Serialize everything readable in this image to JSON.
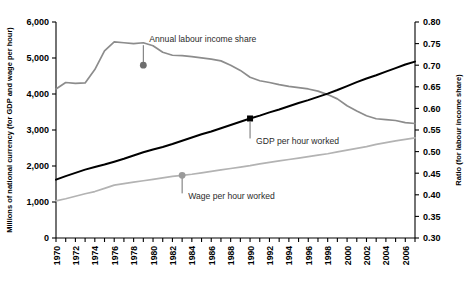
{
  "chart_data": {
    "type": "line",
    "title": "",
    "xlabel": "",
    "ylabel": "Millions of national currency (for GDP and wage per hour)",
    "y2label": "Ratio (for labour income share)",
    "grid": false,
    "legend_position": "inline-annotations",
    "xlim": [
      1970,
      2007
    ],
    "ylim": [
      0,
      6000
    ],
    "y2lim": [
      0.3,
      0.8
    ],
    "yticks": [
      0,
      1000,
      2000,
      3000,
      4000,
      5000,
      6000
    ],
    "ytick_labels": [
      "0",
      "1,000",
      "2,000",
      "3,000",
      "4,000",
      "5,000",
      "6,000"
    ],
    "y2ticks": [
      0.3,
      0.35,
      0.4,
      0.45,
      0.5,
      0.55,
      0.6,
      0.65,
      0.7,
      0.75,
      0.8
    ],
    "y2tick_labels": [
      "0.30",
      "0.35",
      "0.40",
      "0.45",
      "0.50",
      "0.55",
      "0.60",
      "0.65",
      "0.70",
      "0.75",
      "0.80"
    ],
    "xticks": [
      1970,
      1971,
      1972,
      1973,
      1974,
      1975,
      1976,
      1977,
      1978,
      1979,
      1980,
      1981,
      1982,
      1983,
      1984,
      1985,
      1986,
      1987,
      1988,
      1989,
      1990,
      1991,
      1992,
      1993,
      1994,
      1995,
      1996,
      1997,
      1998,
      1999,
      2000,
      2001,
      2002,
      2003,
      2004,
      2005,
      2006,
      2007
    ],
    "xtick_labels": [
      "1970",
      "",
      "1972",
      "",
      "1974",
      "",
      "1976",
      "",
      "1978",
      "",
      "1980",
      "",
      "1982",
      "",
      "1984",
      "",
      "1986",
      "",
      "1988",
      "",
      "1990",
      "",
      "1992",
      "",
      "1994",
      "",
      "1996",
      "",
      "1998",
      "",
      "2000",
      "",
      "2002",
      "",
      "2004",
      "",
      "2006",
      ""
    ],
    "x": [
      1970,
      1971,
      1972,
      1973,
      1974,
      1975,
      1976,
      1977,
      1978,
      1979,
      1980,
      1981,
      1982,
      1983,
      1984,
      1985,
      1986,
      1987,
      1988,
      1989,
      1990,
      1991,
      1992,
      1993,
      1994,
      1995,
      1996,
      1997,
      1998,
      1999,
      2000,
      2001,
      2002,
      2003,
      2004,
      2005,
      2006,
      2007
    ],
    "series": [
      {
        "name": "Annual labour income share",
        "axis": "right",
        "color": "#8c8c8c",
        "units": "ratio",
        "values": [
          0.645,
          0.66,
          0.658,
          0.659,
          0.69,
          0.733,
          0.754,
          0.752,
          0.75,
          0.752,
          0.745,
          0.73,
          0.723,
          0.722,
          0.72,
          0.717,
          0.714,
          0.71,
          0.7,
          0.688,
          0.672,
          0.664,
          0.66,
          0.655,
          0.651,
          0.648,
          0.645,
          0.64,
          0.632,
          0.622,
          0.606,
          0.594,
          0.583,
          0.576,
          0.574,
          0.572,
          0.567,
          0.565
        ]
      },
      {
        "name": "GDP per hour worked",
        "axis": "left",
        "color": "#000000",
        "units": "millions of national currency",
        "values": [
          1620,
          1720,
          1810,
          1900,
          1970,
          2040,
          2120,
          2200,
          2290,
          2380,
          2460,
          2530,
          2610,
          2700,
          2790,
          2880,
          2960,
          3050,
          3140,
          3230,
          3320,
          3400,
          3490,
          3570,
          3660,
          3750,
          3830,
          3920,
          4010,
          4110,
          4220,
          4330,
          4430,
          4520,
          4620,
          4720,
          4820,
          4900
        ]
      },
      {
        "name": "Wage per hour worked",
        "axis": "left",
        "color": "#b3b3b3",
        "units": "millions of national currency",
        "values": [
          1030,
          1090,
          1160,
          1230,
          1290,
          1380,
          1470,
          1510,
          1550,
          1590,
          1630,
          1670,
          1710,
          1740,
          1770,
          1810,
          1850,
          1890,
          1930,
          1970,
          2010,
          2060,
          2100,
          2140,
          2180,
          2220,
          2260,
          2300,
          2340,
          2390,
          2440,
          2490,
          2540,
          2600,
          2650,
          2700,
          2740,
          2780
        ]
      }
    ],
    "annotations": [
      {
        "label": "Annual labour income share",
        "series": "Annual labour income share",
        "marker": "circle",
        "marker_color": "#6e6e6e",
        "x": 1979,
        "y": 0.7
      },
      {
        "label": "GDP per hour worked",
        "series": "GDP per hour worked",
        "marker": "square",
        "marker_color": "#000000",
        "x": 1990,
        "y": 3320
      },
      {
        "label": "Wage per hour worked",
        "series": "Wage per hour worked",
        "marker": "circle",
        "marker_color": "#9a9a9a",
        "x": 1983,
        "y": 1740
      }
    ]
  },
  "caption": {
    "text": ""
  }
}
